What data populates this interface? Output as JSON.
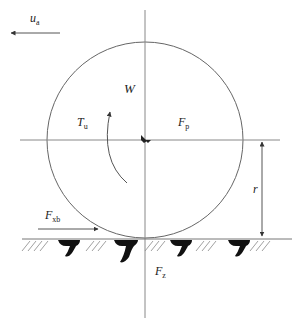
{
  "diagram": {
    "labels": {
      "velocity": {
        "main": "u",
        "sub": "a"
      },
      "weight": {
        "main": "W"
      },
      "torque": {
        "main": "T",
        "sub": "u"
      },
      "push_force": {
        "main": "F",
        "sub": "p"
      },
      "radius": {
        "main": "r"
      },
      "traction_force": {
        "main": "F",
        "sub": "xb"
      },
      "vertical_force": {
        "main": "F",
        "sub": "z"
      }
    },
    "colors": {
      "line": "#555555",
      "tread": "#111111",
      "background": "#ffffff"
    }
  }
}
